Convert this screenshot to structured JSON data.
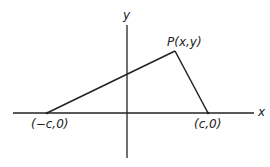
{
  "diagram": {
    "type": "coordinate-geometry",
    "axes": {
      "x_label": "x",
      "y_label": "y"
    },
    "points": {
      "P": {
        "label": "P(x,y)"
      },
      "left_focus": {
        "label": "(−c,0)"
      },
      "right_focus": {
        "label": "(c,0)"
      }
    },
    "segments": [
      {
        "from": "(−c,0)",
        "to": "P(x,y)"
      },
      {
        "from": "P(x,y)",
        "to": "(c,0)"
      }
    ],
    "colors": {
      "stroke": "#222222",
      "background": "#ffffff"
    }
  }
}
